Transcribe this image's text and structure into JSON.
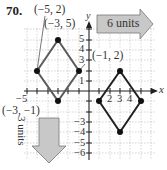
{
  "problem": {
    "number": "70."
  },
  "labels": {
    "p1": "(−5, 2)",
    "p2": "(−3, 5)",
    "p3": "(−1, 2)",
    "p4": "(−3, −1)"
  },
  "axes": {
    "x_label": "x",
    "y_label": "y",
    "x_ticks": [
      "−5",
      "2",
      "3",
      "4"
    ],
    "y_ticks": [
      "5",
      "4",
      "3",
      "1",
      "−3",
      "−4",
      "−5",
      "−6"
    ]
  },
  "arrows": {
    "right": "6 units",
    "down": "3 units"
  },
  "colors": {
    "original_shape": "#555555",
    "translated_shape": "#222222",
    "arrow_fill": "#c8c8c8",
    "grid": "#b0b0b0"
  },
  "shapes": {
    "original": [
      [
        -5,
        2
      ],
      [
        -3,
        5
      ],
      [
        -1,
        2
      ],
      [
        -3,
        -1
      ]
    ],
    "translated": [
      [
        1,
        -1
      ],
      [
        3,
        2
      ],
      [
        5,
        -1
      ],
      [
        3,
        -4
      ]
    ]
  }
}
